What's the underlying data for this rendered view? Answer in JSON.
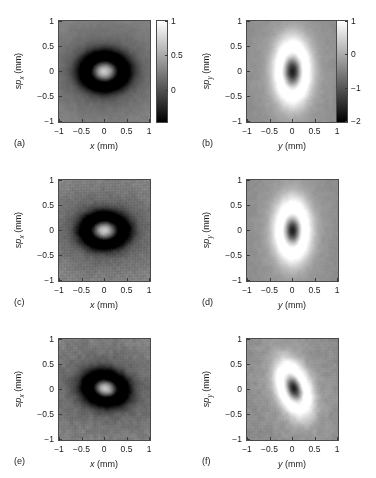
{
  "figure": {
    "background": "#ffffff",
    "axis_color": "#3a3a3a",
    "text_color": "#1a1a1a",
    "columns": 2,
    "rows": 3
  },
  "chart_data": [
    {
      "type": "heatmap",
      "panel": "(a)",
      "title": "",
      "xlabel": "x (mm)",
      "ylabel": "sp_x (mm)",
      "xlim": [
        -1,
        1
      ],
      "ylim": [
        -1,
        1
      ],
      "xticks": [
        -1,
        -0.5,
        0,
        0.5,
        1
      ],
      "xticklabels": [
        "-1",
        "-0.5",
        "0",
        "0.5",
        "1"
      ],
      "yticks": [
        -1,
        -0.5,
        0,
        0.5,
        1
      ],
      "yticklabels": [
        "-1",
        "-0.5",
        "0",
        "0.5",
        "1"
      ],
      "colormap": "gray",
      "grid": false,
      "colorbar": {
        "present": true,
        "vmin": -0.45,
        "vmax": 1,
        "ticks": [
          1,
          0.5,
          0
        ],
        "ticklabels": [
          "1",
          "0.5",
          "0"
        ],
        "position": "right"
      },
      "field": {
        "kind": "bright-core-dark-ring",
        "center": [
          0,
          0
        ],
        "core_sigma_x": 0.16,
        "core_sigma_y": 0.115,
        "ring_radius": 0.33,
        "ring_sigma": 0.16,
        "background_level": 0.33,
        "core_peak": 1.0,
        "ring_depth": -0.45,
        "tilt_deg": 0,
        "noise": 0.035,
        "speckle": 0.0
      }
    },
    {
      "type": "heatmap",
      "panel": "(b)",
      "title": "",
      "xlabel": "y (mm)",
      "ylabel": "sp_y (mm)",
      "xlim": [
        -1,
        1
      ],
      "ylim": [
        -1,
        1
      ],
      "xticks": [
        -1,
        -0.5,
        0,
        0.5,
        1
      ],
      "xticklabels": [
        "-1",
        "-0.5",
        "0",
        "0.5",
        "1"
      ],
      "yticks": [
        -1,
        -0.5,
        0,
        0.5,
        1
      ],
      "yticklabels": [
        "-1",
        "-0.5",
        "0",
        "0.5",
        "1"
      ],
      "colormap": "gray",
      "grid": false,
      "colorbar": {
        "present": true,
        "vmin": -2,
        "vmax": 1,
        "ticks": [
          1,
          0,
          -1,
          -2
        ],
        "ticklabels": [
          "1",
          "0",
          "-1",
          "-2"
        ],
        "position": "right"
      },
      "field": {
        "kind": "dark-core-bright-halo",
        "center": [
          0,
          0
        ],
        "core_sigma_x": 0.115,
        "core_sigma_y": 0.185,
        "ring_radius": 0.34,
        "ring_sigma": 0.2,
        "background_level": -0.38,
        "core_peak": -2.0,
        "ring_depth": 1.0,
        "tilt_deg": 0,
        "noise": 0.03,
        "speckle": 0.0
      }
    },
    {
      "type": "heatmap",
      "panel": "(c)",
      "title": "",
      "xlabel": "x (mm)",
      "ylabel": "sp_x (mm)",
      "xlim": [
        -1,
        1
      ],
      "ylim": [
        -1,
        1
      ],
      "xticks": [
        -1,
        -0.5,
        0,
        0.5,
        1
      ],
      "xticklabels": [
        "-1",
        "-0.5",
        "0",
        "0.5",
        "1"
      ],
      "yticks": [
        -1,
        -0.5,
        0,
        0.5,
        1
      ],
      "yticklabels": [
        "-1",
        "-0.5",
        "0",
        "0.5",
        "1"
      ],
      "colormap": "gray",
      "grid": false,
      "colorbar": {
        "present": false
      },
      "field": {
        "kind": "bright-core-dark-ring",
        "center": [
          0,
          0
        ],
        "core_sigma_x": 0.155,
        "core_sigma_y": 0.105,
        "ring_radius": 0.32,
        "ring_sigma": 0.15,
        "background_level": 0.33,
        "core_peak": 1.0,
        "ring_depth": -0.45,
        "tilt_deg": 0,
        "noise": 0.05,
        "speckle": 0.16
      }
    },
    {
      "type": "heatmap",
      "panel": "(d)",
      "title": "",
      "xlabel": "y (mm)",
      "ylabel": "sp_y (mm)",
      "xlim": [
        -1,
        1
      ],
      "ylim": [
        -1,
        1
      ],
      "xticks": [
        -1,
        -0.5,
        0,
        0.5,
        1
      ],
      "xticklabels": [
        "-1",
        "-0.5",
        "0",
        "0.5",
        "1"
      ],
      "yticks": [
        -1,
        -0.5,
        0,
        0.5,
        1
      ],
      "yticklabels": [
        "-1",
        "-0.5",
        "0",
        "0.5",
        "1"
      ],
      "colormap": "gray",
      "grid": false,
      "colorbar": {
        "present": false
      },
      "field": {
        "kind": "dark-core-bright-halo",
        "center": [
          0,
          0
        ],
        "core_sigma_x": 0.105,
        "core_sigma_y": 0.165,
        "ring_radius": 0.32,
        "ring_sigma": 0.2,
        "background_level": -0.38,
        "core_peak": -2.0,
        "ring_depth": 1.0,
        "tilt_deg": 0,
        "noise": 0.03,
        "speckle": 0.0
      }
    },
    {
      "type": "heatmap",
      "panel": "(e)",
      "title": "",
      "xlabel": "x (mm)",
      "ylabel": "sp_x (mm)",
      "xlim": [
        -1,
        1
      ],
      "ylim": [
        -1,
        1
      ],
      "xticks": [
        -1,
        -0.5,
        0,
        0.5,
        1
      ],
      "xticklabels": [
        "-1",
        "-0.5",
        "0",
        "0.5",
        "1"
      ],
      "yticks": [
        -1,
        -0.5,
        0,
        0.5,
        1
      ],
      "yticklabels": [
        "-1",
        "-0.5",
        "0",
        "0.5",
        "1"
      ],
      "colormap": "gray",
      "grid": false,
      "colorbar": {
        "present": false
      },
      "field": {
        "kind": "bright-core-dark-ring",
        "center": [
          0.02,
          0.02
        ],
        "core_sigma_x": 0.14,
        "core_sigma_y": 0.095,
        "ring_radius": 0.3,
        "ring_sigma": 0.15,
        "background_level": 0.3,
        "core_peak": 1.0,
        "ring_depth": -0.45,
        "tilt_deg": -8,
        "noise": 0.075,
        "speckle": 0.1
      }
    },
    {
      "type": "heatmap",
      "panel": "(f)",
      "title": "",
      "xlabel": "y (mm)",
      "ylabel": "sp_y (mm)",
      "xlim": [
        -1,
        1
      ],
      "ylim": [
        -1,
        1
      ],
      "xticks": [
        -1,
        -0.5,
        0,
        0.5,
        1
      ],
      "xticklabels": [
        "-1",
        "-0.5",
        "0",
        "0.5",
        "1"
      ],
      "yticks": [
        -1,
        -0.5,
        0,
        0.5,
        1
      ],
      "yticklabels": [
        "-1",
        "-0.5",
        "0",
        "0.5",
        "1"
      ],
      "colormap": "gray",
      "grid": false,
      "colorbar": {
        "present": false
      },
      "field": {
        "kind": "dark-core-bright-halo",
        "center": [
          0.03,
          0.02
        ],
        "core_sigma_x": 0.095,
        "core_sigma_y": 0.16,
        "ring_radius": 0.3,
        "ring_sigma": 0.175,
        "background_level": -0.38,
        "core_peak": -2.0,
        "ring_depth": 1.0,
        "tilt_deg": 25,
        "noise": 0.06,
        "speckle": 0.07
      }
    }
  ]
}
